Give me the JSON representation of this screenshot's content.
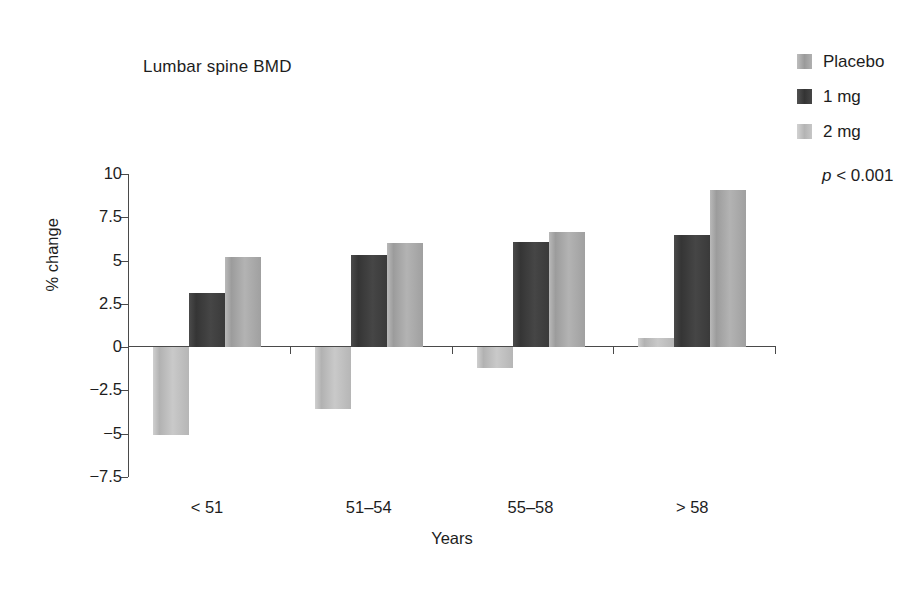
{
  "chart_data": {
    "type": "bar",
    "title": "Lumbar spine BMD",
    "xlabel": "Years",
    "ylabel": "% change",
    "categories": [
      "< 51",
      "51–54",
      "55–58",
      "> 58"
    ],
    "series": [
      {
        "name": "Placebo",
        "color": "#b2b2b2",
        "values": [
          -5.1,
          -3.6,
          -1.2,
          0.5
        ]
      },
      {
        "name": "1 mg",
        "color": "#3a3a3a",
        "values": [
          3.1,
          5.35,
          6.1,
          6.5
        ]
      },
      {
        "name": "2 mg",
        "color": "#a8a8a8",
        "values": [
          5.2,
          6.0,
          6.65,
          9.1
        ]
      }
    ],
    "ylim": [
      -7.5,
      10
    ],
    "yticks": [
      10,
      7.5,
      5,
      2.5,
      0,
      -2.5,
      -5,
      -7.5
    ],
    "ytick_labels": [
      "10",
      "7.5",
      "5",
      "2.5",
      "0",
      "−2.5",
      "−5",
      "−7.5"
    ],
    "grid": false,
    "legend_position": "top-right",
    "annotation": "p < 0.001"
  },
  "annotations": {
    "p_value_symbol": "p",
    "p_value_rest": " < 0.001"
  },
  "legend": {
    "entries": [
      {
        "label": "Placebo"
      },
      {
        "label": "1 mg"
      },
      {
        "label": "2 mg"
      }
    ]
  }
}
